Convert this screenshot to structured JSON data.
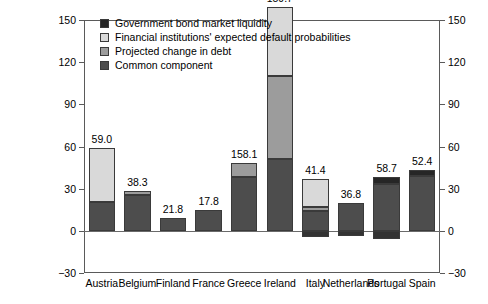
{
  "chart_data": {
    "type": "bar",
    "title": "",
    "subtitle": "",
    "xlabel": "",
    "ylabel": "",
    "ylim": [
      -30,
      150
    ],
    "yticks": [
      150,
      120,
      90,
      60,
      30,
      0,
      -30
    ],
    "ytick_labels": [
      "150",
      "120",
      "90",
      "60",
      "30",
      "0",
      "-30"
    ],
    "grid": false,
    "stacked": true,
    "dual_axis": true,
    "legend_position": "top-left",
    "categories": [
      "Austria",
      "Belgium",
      "Finland",
      "France",
      "Greece",
      "Ireland",
      "Italy",
      "Netherlands",
      "Portugal",
      "Spain"
    ],
    "series": [
      {
        "name": "Government bond market liquidity",
        "color": "#262626",
        "values": [
          0.0,
          0.0,
          0.0,
          0.0,
          0.0,
          0.0,
          0.0,
          0.0,
          5.5,
          4.5
        ]
      },
      {
        "name": "Financial institutions' expected default probabilities",
        "color": "#d9d9d9",
        "values": [
          38.5,
          0.0,
          0.0,
          0.0,
          0.0,
          49.0,
          20.0,
          0.0,
          0.0,
          0.0
        ]
      },
      {
        "name": "Projected change in debt",
        "color": "#9c9c9c",
        "values": [
          0.0,
          2.5,
          0.0,
          0.0,
          9.5,
          59.5,
          3.0,
          0.0,
          0.0,
          0.0
        ]
      },
      {
        "name": "Common component",
        "color": "#4d4d4d",
        "values": [
          20.5,
          25.5,
          9.0,
          14.5,
          38.5,
          51.0,
          14.0,
          19.5,
          33.0,
          39.0
        ]
      },
      {
        "name": "Negative common component",
        "color": "#333333",
        "values": [
          0.0,
          0.0,
          0.0,
          0.0,
          0.0,
          0.0,
          -4.5,
          -4.0,
          -6.0,
          0.0
        ]
      }
    ],
    "data_labels": [
      "59.0",
      "38.3",
      "21.8",
      "17.8",
      "158.1",
      "159.7",
      "41.4",
      "36.8",
      "58.7",
      "52.4"
    ],
    "data_label_values": [
      59.0,
      38.3,
      21.8,
      17.8,
      158.1,
      159.7,
      41.4,
      36.8,
      58.7,
      52.4
    ]
  },
  "legend": {
    "items": [
      {
        "label": "Government bond market liquidity",
        "color": "#262626"
      },
      {
        "label": "Financial institutions' expected default probabilities",
        "color": "#d9d9d9"
      },
      {
        "label": "Projected change in debt",
        "color": "#9c9c9c"
      },
      {
        "label": "Common component",
        "color": "#4d4d4d"
      }
    ]
  },
  "axis": {
    "left_labels": [
      "150",
      "120",
      "90",
      "60",
      "30",
      "0",
      "-30"
    ],
    "right_labels": [
      "150",
      "120",
      "90",
      "60",
      "30",
      "0",
      "-30"
    ]
  }
}
